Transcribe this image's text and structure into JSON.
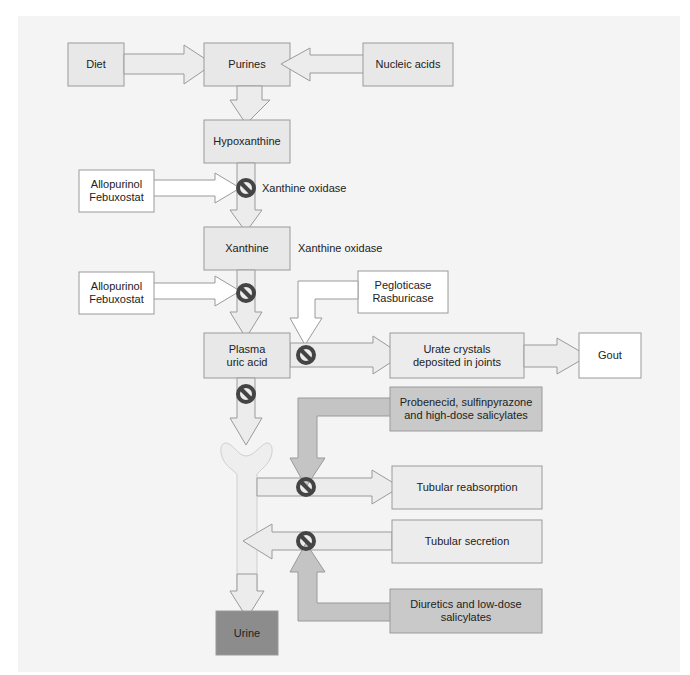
{
  "colors": {
    "panel": "#f4f4f4",
    "box_light": "#ebebeb",
    "box_white": "#ffffff",
    "box_mid": "#c9c9c9",
    "box_dark": "#8c8c8c",
    "stroke": "#9a9a9a",
    "tubule": "#eeeeee",
    "inhibitor": "#444444"
  },
  "nodes": {
    "diet": "Diet",
    "purines": "Purines",
    "nucleic_acids": "Nucleic acids",
    "hypoxanthine": "Hypoxanthine",
    "xanthine": "Xanthine",
    "plasma_uric_acid_line1": "Plasma",
    "plasma_uric_acid_line2": "uric acid",
    "urate_crystals_line1": "Urate crystals",
    "urate_crystals_line2": "deposited in joints",
    "gout": "Gout",
    "tubular_reabsorption": "Tubular reabsorption",
    "tubular_secretion": "Tubular secretion",
    "urine": "Urine"
  },
  "drugs": {
    "xo_inhibitor_1_line1": "Allopurinol",
    "xo_inhibitor_1_line2": "Febuxostat",
    "xo_inhibitor_2_line1": "Allopurinol",
    "xo_inhibitor_2_line2": "Febuxostat",
    "uricase_line1": "Pegloticase",
    "uricase_line2": "Rasburicase",
    "uricosurics_line1": "Probenecid, sulfinpyrazone",
    "uricosurics_line2": "and high-dose salicylates",
    "secretion_inhibitors_line1": "Diuretics and low-dose",
    "secretion_inhibitors_line2": "salicylates"
  },
  "enzymes": {
    "step1": "Xanthine oxidase",
    "step2": "Xanthine oxidase"
  },
  "icons": {
    "inhibitor": "prohibition-icon"
  }
}
